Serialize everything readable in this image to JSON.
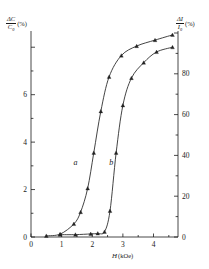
{
  "chart_data": {
    "type": "line",
    "title": "",
    "xlabel": "H (kOe)",
    "ylabel_left": "ΔC/C₀ (%)",
    "ylabel_right": "ΔI/I₀ (%)",
    "xlim": [
      0,
      4.8
    ],
    "ylim_left": [
      0,
      8.6
    ],
    "ylim_right": [
      0,
      100
    ],
    "xticks": [
      0,
      1,
      2,
      3,
      4
    ],
    "xtick_labels": [
      "0",
      "1",
      "2",
      "3",
      "4"
    ],
    "xminor": [
      0.5,
      1.5,
      2.5,
      3.5,
      4.5
    ],
    "yticks_left": [
      0,
      2,
      4,
      6,
      8
    ],
    "ytick_labels_left": [
      "0",
      "2",
      "4",
      "6",
      ""
    ],
    "yminor_left": [
      1,
      3,
      5,
      7
    ],
    "yticks_right": [
      0,
      20,
      40,
      60,
      80,
      100
    ],
    "ytick_labels_right": [
      "0",
      "20",
      "40",
      "60",
      "80",
      ""
    ],
    "yminor_right": [
      10,
      30,
      50,
      70,
      90
    ],
    "grid": false,
    "legend_position": "inline-annotations",
    "series": [
      {
        "name": "a",
        "label": "a",
        "label_x": 1.45,
        "label_y": 3.05,
        "marker": "triangle",
        "y_axis": "left",
        "points": [
          {
            "x": 0.5,
            "y": 0.05
          },
          {
            "x": 0.95,
            "y": 0.12
          },
          {
            "x": 1.4,
            "y": 0.55
          },
          {
            "x": 1.62,
            "y": 1.05
          },
          {
            "x": 1.85,
            "y": 2.05
          },
          {
            "x": 2.05,
            "y": 3.55
          },
          {
            "x": 2.28,
            "y": 5.3
          },
          {
            "x": 2.55,
            "y": 6.75
          },
          {
            "x": 2.95,
            "y": 7.65
          },
          {
            "x": 3.45,
            "y": 8.05
          },
          {
            "x": 4.05,
            "y": 8.3
          },
          {
            "x": 4.62,
            "y": 8.52
          }
        ]
      },
      {
        "name": "b",
        "label": "b",
        "label_x": 2.62,
        "label_y": 3.05,
        "marker": "triangle",
        "y_axis": "left",
        "points": [
          {
            "x": 0.95,
            "y": 0.1
          },
          {
            "x": 1.45,
            "y": 0.1
          },
          {
            "x": 1.95,
            "y": 0.13
          },
          {
            "x": 2.18,
            "y": 0.15
          },
          {
            "x": 2.4,
            "y": 0.22
          },
          {
            "x": 2.58,
            "y": 1.1
          },
          {
            "x": 2.78,
            "y": 3.55
          },
          {
            "x": 3.0,
            "y": 5.55
          },
          {
            "x": 3.28,
            "y": 6.7
          },
          {
            "x": 3.68,
            "y": 7.35
          },
          {
            "x": 4.1,
            "y": 7.8
          },
          {
            "x": 4.62,
            "y": 8.0
          }
        ]
      }
    ]
  },
  "labels": {
    "left_axis_numerator": "ΔC",
    "left_axis_denominator": "C",
    "left_axis_denom_sub": "0",
    "left_axis_unit": "(%)",
    "right_axis_numerator": "ΔI",
    "right_axis_denominator": "I",
    "right_axis_denom_sub": "0",
    "right_axis_unit": "(%)",
    "x_axis_symbol": "H",
    "x_axis_unit": "(kOe)",
    "curve_a": "a",
    "curve_b": "b"
  },
  "colors": {
    "ink": "#1a1a1a",
    "background": "#ffffff",
    "curve": "#222222"
  }
}
